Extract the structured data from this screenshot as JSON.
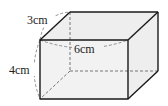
{
  "figure": {
    "type": "rectangular-prism",
    "labels": {
      "depth": "3cm",
      "width": "6cm",
      "height": "4cm"
    },
    "dimensions": {
      "depth": 3,
      "width": 6,
      "height": 4,
      "unit": "cm"
    },
    "colors": {
      "edge": "#1a1a1a",
      "face": "#eeeeee",
      "dashed": "#555555",
      "background": "#ffffff"
    }
  }
}
